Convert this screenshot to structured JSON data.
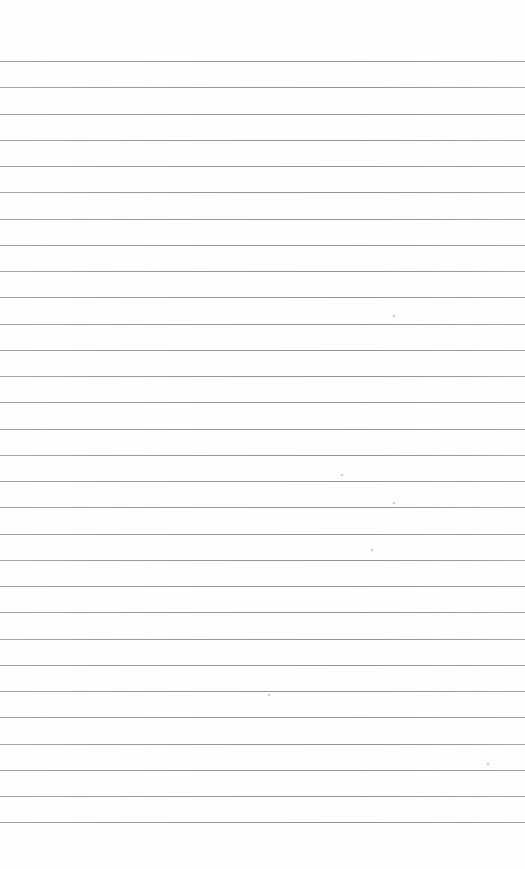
{
  "page": {
    "type": "lined-paper",
    "background_color": "#fefefe",
    "line_color": "#8c8c8c",
    "line_count": 30,
    "first_line_y": 61,
    "line_spacing": 26.25,
    "text": ""
  },
  "specks": [
    {
      "x": 393,
      "y": 315
    },
    {
      "x": 341,
      "y": 474
    },
    {
      "x": 393,
      "y": 502
    },
    {
      "x": 371,
      "y": 549
    },
    {
      "x": 268,
      "y": 694
    },
    {
      "x": 487,
      "y": 763
    }
  ]
}
